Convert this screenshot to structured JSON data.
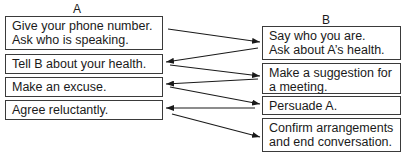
{
  "diagram": {
    "columns": {
      "a": {
        "label": "A"
      },
      "b": {
        "label": "B"
      }
    },
    "a_boxes": [
      {
        "text": "Give your phone number.\nAsk who is speaking."
      },
      {
        "text": "Tell B about your health."
      },
      {
        "text": "Make an excuse."
      },
      {
        "text": "Agree reluctantly."
      }
    ],
    "b_boxes": [
      {
        "text": "Say who you are.\nAsk about A’s health."
      },
      {
        "text": "Make a suggestion for\na meeting."
      },
      {
        "text": "Persuade A."
      },
      {
        "text": "Confirm arrangements\nand end conversation."
      }
    ],
    "flow": [
      {
        "from": "A1",
        "to": "B1"
      },
      {
        "from": "B1",
        "to": "A2"
      },
      {
        "from": "A2",
        "to": "B2"
      },
      {
        "from": "B2",
        "to": "A3"
      },
      {
        "from": "A3",
        "to": "B3"
      },
      {
        "from": "B3",
        "to": "A4"
      },
      {
        "from": "A4",
        "to": "B4"
      }
    ],
    "colors": {
      "line": "#1a1a1a",
      "border": "#3a3a3a",
      "background": "#ffffff"
    }
  }
}
